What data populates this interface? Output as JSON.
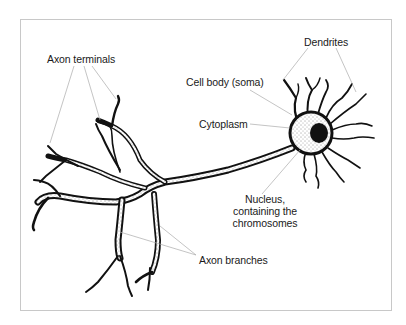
{
  "diagram": {
    "labels": {
      "dendrites": "Dendrites",
      "axon_terminals": "Axon terminals",
      "cell_body": "Cell body (soma)",
      "cytoplasm": "Cytoplasm",
      "nucleus_line1": "Nucleus,",
      "nucleus_line2": "containing the",
      "nucleus_line3": "chromosomes",
      "axon_branches": "Axon branches"
    },
    "colors": {
      "ink": "#111111",
      "leader_line": "#aaaaaa",
      "frame": "#c8c8c8",
      "background": "#ffffff"
    }
  }
}
